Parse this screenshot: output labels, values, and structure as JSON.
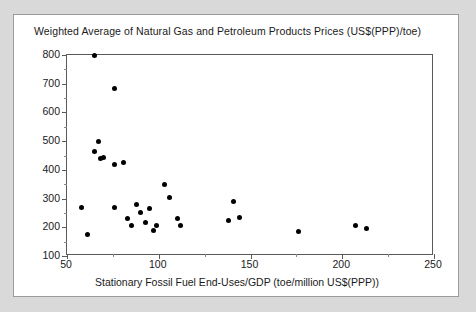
{
  "chart_data": {
    "type": "scatter",
    "title": "Weighted Average of Natural Gas and Petroleum Products Prices (US$(PPP)/toe)",
    "xlabel": "Stationary Fossil Fuel End-Uses/GDP (toe/million US$(PPP))",
    "ylabel": "Weighted Average of Natural Gas and Petroleum Products Prices (US$(PPP)/toe)",
    "xlim": [
      50,
      250
    ],
    "ylim": [
      100,
      800
    ],
    "xticks": [
      50,
      100,
      150,
      200,
      250
    ],
    "yticks": [
      100,
      200,
      300,
      400,
      500,
      600,
      700,
      800
    ],
    "x_minor_step": 25,
    "y_minor_step": 50,
    "grid": false,
    "legend": null,
    "marker": "filled-circle",
    "marker_color": "#000000",
    "points": [
      {
        "x": 58,
        "y": 270
      },
      {
        "x": 61,
        "y": 175
      },
      {
        "x": 65,
        "y": 800
      },
      {
        "x": 65,
        "y": 465
      },
      {
        "x": 67,
        "y": 500
      },
      {
        "x": 68,
        "y": 440
      },
      {
        "x": 70,
        "y": 442
      },
      {
        "x": 76,
        "y": 270
      },
      {
        "x": 76,
        "y": 420
      },
      {
        "x": 76,
        "y": 683
      },
      {
        "x": 81,
        "y": 425
      },
      {
        "x": 83,
        "y": 230
      },
      {
        "x": 85,
        "y": 205
      },
      {
        "x": 88,
        "y": 280
      },
      {
        "x": 90,
        "y": 250
      },
      {
        "x": 93,
        "y": 215
      },
      {
        "x": 95,
        "y": 265
      },
      {
        "x": 97,
        "y": 190
      },
      {
        "x": 99,
        "y": 205
      },
      {
        "x": 103,
        "y": 350
      },
      {
        "x": 106,
        "y": 305
      },
      {
        "x": 110,
        "y": 230
      },
      {
        "x": 112,
        "y": 205
      },
      {
        "x": 138,
        "y": 225
      },
      {
        "x": 141,
        "y": 290
      },
      {
        "x": 144,
        "y": 235
      },
      {
        "x": 176,
        "y": 185
      },
      {
        "x": 207,
        "y": 205
      },
      {
        "x": 213,
        "y": 195
      }
    ]
  },
  "figure": {
    "top_caption_fragment": ""
  }
}
